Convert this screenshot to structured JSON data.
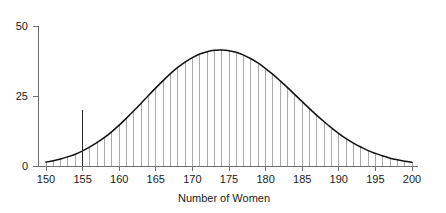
{
  "chart_data": {
    "type": "bar",
    "title": "",
    "subtitle": "",
    "xlabel": "Number of Women",
    "ylabel": "",
    "xlim": [
      150,
      200
    ],
    "ylim": [
      0,
      50
    ],
    "grid": false,
    "legend": null,
    "x_ticks": [
      150,
      155,
      160,
      165,
      170,
      175,
      180,
      185,
      190,
      195,
      200
    ],
    "x_tick_labels": [
      "150",
      "155",
      "160",
      "165",
      "170",
      "175",
      "180",
      "185",
      "190",
      "195",
      "200"
    ],
    "y_ticks": [
      0,
      25,
      50
    ],
    "y_tick_labels": [
      "0",
      "25",
      "50"
    ],
    "series_description": "Binomial sampling distribution for the number of women, shown as thin vertical bars with a fitted normal density curve overlaid. One bar at 155 is drawn in dark emphasis.",
    "highlight": {
      "x": 155,
      "value": 20,
      "color": "#2b2b2b",
      "label": "observed-value-marker"
    },
    "bar_color": "#9a9a9a",
    "curve_color": "#111111",
    "categories": [
      150,
      151,
      152,
      153,
      154,
      155,
      156,
      157,
      158,
      159,
      160,
      161,
      162,
      163,
      164,
      165,
      166,
      167,
      168,
      169,
      170,
      171,
      172,
      173,
      174,
      175,
      176,
      177,
      178,
      179,
      180,
      181,
      182,
      183,
      184,
      185,
      186,
      187,
      188,
      189,
      190,
      191,
      192,
      193,
      194,
      195,
      196,
      197,
      198,
      199,
      200
    ],
    "values": [
      1.4,
      1.9,
      2.5,
      3.3,
      4.2,
      5.4,
      6.8,
      8.4,
      10.2,
      12.3,
      14.6,
      17.1,
      19.7,
      22.4,
      25.2,
      27.9,
      30.5,
      33.0,
      35.2,
      37.1,
      38.7,
      40.0,
      40.8,
      41.3,
      41.4,
      41.2,
      40.6,
      39.6,
      38.3,
      36.7,
      34.8,
      32.7,
      30.4,
      28.0,
      25.5,
      23.0,
      20.5,
      18.1,
      15.8,
      13.6,
      11.6,
      9.8,
      8.2,
      6.8,
      5.5,
      4.5,
      3.6,
      2.8,
      2.2,
      1.7,
      1.3
    ],
    "curve_x": [
      150,
      151,
      152,
      153,
      154,
      155,
      156,
      157,
      158,
      159,
      160,
      161,
      162,
      163,
      164,
      165,
      166,
      167,
      168,
      169,
      170,
      171,
      172,
      173,
      174,
      175,
      176,
      177,
      178,
      179,
      180,
      181,
      182,
      183,
      184,
      185,
      186,
      187,
      188,
      189,
      190,
      191,
      192,
      193,
      194,
      195,
      196,
      197,
      198,
      199,
      200
    ],
    "curve_y": [
      1.4,
      1.9,
      2.5,
      3.3,
      4.2,
      5.4,
      6.8,
      8.4,
      10.2,
      12.3,
      14.6,
      17.1,
      19.7,
      22.4,
      25.2,
      27.9,
      30.5,
      33.0,
      35.2,
      37.1,
      38.7,
      40.0,
      40.8,
      41.3,
      41.4,
      41.2,
      40.6,
      39.6,
      38.3,
      36.7,
      34.8,
      32.7,
      30.4,
      28.0,
      25.5,
      23.0,
      20.5,
      18.1,
      15.8,
      13.6,
      11.6,
      9.8,
      8.2,
      6.8,
      5.5,
      4.5,
      3.6,
      2.8,
      2.2,
      1.7,
      1.3
    ]
  },
  "geometry": {
    "plot_left": 46,
    "plot_right": 412,
    "baseline_y": 166,
    "y_top_px": 26,
    "y_zero_px": 166,
    "axis_top_y": 26,
    "xlabel_x": 224,
    "xlabel_y": 202
  }
}
